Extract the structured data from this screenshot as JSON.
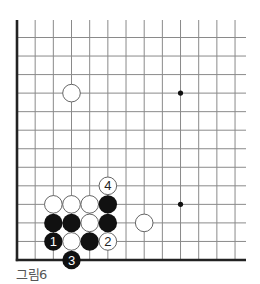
{
  "diagram": {
    "type": "go-board-corner",
    "caption": "그림6",
    "colors": {
      "line": "#8a8a8a",
      "edge": "#222222",
      "black_stone": "#111111",
      "white_stone": "#ffffff",
      "white_stroke": "#555555",
      "caption": "#555555"
    },
    "grid": {
      "columns": 13,
      "rows": 13,
      "origin_x": 17,
      "origin_y": 37.5,
      "spacing_x": 18.17,
      "spacing_y": 18.54,
      "extend_right_to": 246,
      "extend_top_to": 20,
      "thick_edges": [
        "left",
        "bottom"
      ]
    },
    "hoshi": [
      {
        "col": 9,
        "row": 3
      },
      {
        "col": 9,
        "row": 9
      }
    ],
    "stones": [
      {
        "color": "white",
        "col": 3,
        "row": 3,
        "label": ""
      },
      {
        "color": "white",
        "col": 5,
        "row": 8,
        "label": "4"
      },
      {
        "color": "white",
        "col": 2,
        "row": 9,
        "label": ""
      },
      {
        "color": "white",
        "col": 3,
        "row": 9,
        "label": ""
      },
      {
        "color": "white",
        "col": 4,
        "row": 9,
        "label": ""
      },
      {
        "color": "black",
        "col": 5,
        "row": 9,
        "label": ""
      },
      {
        "color": "black",
        "col": 2,
        "row": 10,
        "label": ""
      },
      {
        "color": "black",
        "col": 3,
        "row": 10,
        "label": ""
      },
      {
        "color": "white",
        "col": 4,
        "row": 10,
        "label": ""
      },
      {
        "color": "black",
        "col": 5,
        "row": 10,
        "label": ""
      },
      {
        "color": "white",
        "col": 7,
        "row": 10,
        "label": ""
      },
      {
        "color": "black",
        "col": 2,
        "row": 11,
        "label": "1"
      },
      {
        "color": "white",
        "col": 3,
        "row": 11,
        "label": ""
      },
      {
        "color": "black",
        "col": 4,
        "row": 11,
        "label": ""
      },
      {
        "color": "white",
        "col": 5,
        "row": 11,
        "label": "2"
      },
      {
        "color": "black",
        "col": 3,
        "row": 12,
        "label": "3"
      }
    ]
  }
}
